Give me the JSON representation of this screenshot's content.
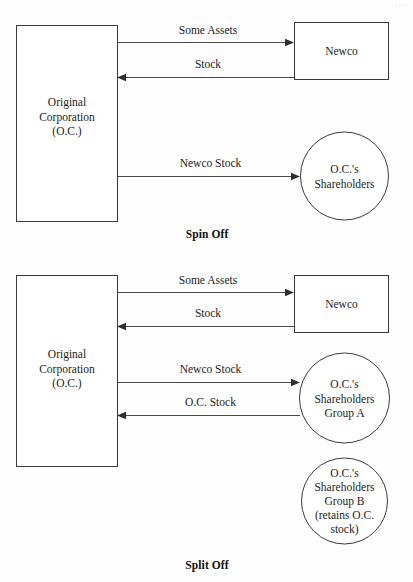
{
  "page": {
    "corner_mark": "ppx",
    "background_color": "#fefefe",
    "line_color": "#3a3a3a"
  },
  "diagrams": [
    {
      "id": "spin-off",
      "caption": "Spin Off",
      "nodes": {
        "original_corporation": {
          "shape": "rect",
          "lines": [
            "Original",
            "Corporation",
            "(O.C.)"
          ]
        },
        "newco": {
          "shape": "rect",
          "lines": [
            "Newco"
          ]
        },
        "shareholders": {
          "shape": "circle",
          "lines": [
            "O.C.'s",
            "Shareholders"
          ]
        }
      },
      "edges": [
        {
          "label": "Some Assets",
          "from": "original_corporation",
          "to": "newco",
          "direction": "right"
        },
        {
          "label": "Stock",
          "from": "newco",
          "to": "original_corporation",
          "direction": "left"
        },
        {
          "label": "Newco Stock",
          "from": "original_corporation",
          "to": "shareholders",
          "direction": "right"
        }
      ]
    },
    {
      "id": "split-off",
      "caption": "Split Off",
      "nodes": {
        "original_corporation": {
          "shape": "rect",
          "lines": [
            "Original",
            "Corporation",
            "(O.C.)"
          ]
        },
        "newco": {
          "shape": "rect",
          "lines": [
            "Newco"
          ]
        },
        "shareholders_group_a": {
          "shape": "circle",
          "lines": [
            "O.C.'s",
            "Shareholders",
            "Group A"
          ]
        },
        "shareholders_group_b": {
          "shape": "circle",
          "lines": [
            "O.C.'s",
            "Shareholders",
            "Group B",
            "(retains O.C.",
            "stock)"
          ]
        }
      },
      "edges": [
        {
          "label": "Some Assets",
          "from": "original_corporation",
          "to": "newco",
          "direction": "right"
        },
        {
          "label": "Stock",
          "from": "newco",
          "to": "original_corporation",
          "direction": "left"
        },
        {
          "label": "Newco Stock",
          "from": "original_corporation",
          "to": "shareholders_group_a",
          "direction": "right"
        },
        {
          "label": "O.C. Stock",
          "from": "shareholders_group_a",
          "to": "original_corporation",
          "direction": "left"
        }
      ]
    }
  ]
}
